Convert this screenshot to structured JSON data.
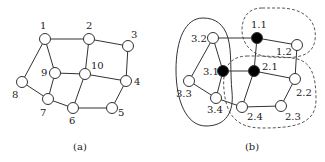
{
  "panel_a": {
    "caption": "(a)",
    "nodes": [
      {
        "id": "1",
        "x": 45,
        "y": 39,
        "lx": 40,
        "ly": 29
      },
      {
        "id": "2",
        "x": 89,
        "y": 39,
        "lx": 86,
        "ly": 29
      },
      {
        "id": "3",
        "x": 128,
        "y": 46,
        "lx": 131,
        "ly": 38
      },
      {
        "id": "4",
        "x": 126,
        "y": 81,
        "lx": 134,
        "ly": 85
      },
      {
        "id": "5",
        "x": 112,
        "y": 108,
        "lx": 118,
        "ly": 116
      },
      {
        "id": "6",
        "x": 73,
        "y": 108,
        "lx": 69,
        "ly": 124
      },
      {
        "id": "7",
        "x": 48,
        "y": 99,
        "lx": 40,
        "ly": 116
      },
      {
        "id": "8",
        "x": 22,
        "y": 82,
        "lx": 12,
        "ly": 98
      },
      {
        "id": "9",
        "x": 55,
        "y": 73,
        "lx": 41,
        "ly": 76
      },
      {
        "id": "10",
        "x": 85,
        "y": 74,
        "lx": 91,
        "ly": 69
      }
    ],
    "edges": [
      [
        "1",
        "2"
      ],
      [
        "2",
        "3"
      ],
      [
        "3",
        "4"
      ],
      [
        "4",
        "5"
      ],
      [
        "5",
        "6"
      ],
      [
        "6",
        "7"
      ],
      [
        "7",
        "8"
      ],
      [
        "8",
        "1"
      ],
      [
        "1",
        "9"
      ],
      [
        "9",
        "7"
      ],
      [
        "9",
        "10"
      ],
      [
        "10",
        "2"
      ],
      [
        "10",
        "4"
      ],
      [
        "10",
        "6"
      ]
    ]
  },
  "panel_b": {
    "caption": "(b)",
    "nodes": [
      {
        "id": "3.2",
        "x": 213,
        "y": 38,
        "lx": 191,
        "ly": 42,
        "filled": false
      },
      {
        "id": "1.1",
        "x": 257,
        "y": 38,
        "lx": 251,
        "ly": 28,
        "filled": true
      },
      {
        "id": "1.2",
        "x": 297,
        "y": 45,
        "lx": 276,
        "ly": 55,
        "filled": false
      },
      {
        "id": "3.1",
        "x": 223,
        "y": 71,
        "lx": 203,
        "ly": 75,
        "filled": true
      },
      {
        "id": "2.1",
        "x": 254,
        "y": 71,
        "lx": 262,
        "ly": 70,
        "filled": true
      },
      {
        "id": "2.2",
        "x": 295,
        "y": 79,
        "lx": 296,
        "ly": 96,
        "filled": false
      },
      {
        "id": "3.3",
        "x": 189,
        "y": 81,
        "lx": 176,
        "ly": 97,
        "filled": false
      },
      {
        "id": "3.4",
        "x": 216,
        "y": 98,
        "lx": 207,
        "ly": 113,
        "filled": false
      },
      {
        "id": "2.4",
        "x": 242,
        "y": 107,
        "lx": 247,
        "ly": 120,
        "filled": false
      },
      {
        "id": "2.3",
        "x": 281,
        "y": 106,
        "lx": 285,
        "ly": 120,
        "filled": false
      }
    ],
    "edges": [
      [
        "3.2",
        "1.1"
      ],
      [
        "1.1",
        "1.2"
      ],
      [
        "1.2",
        "2.2"
      ],
      [
        "2.2",
        "2.3"
      ],
      [
        "2.3",
        "2.4"
      ],
      [
        "2.4",
        "3.4"
      ],
      [
        "3.4",
        "3.3"
      ],
      [
        "3.3",
        "3.2"
      ],
      [
        "3.2",
        "3.1"
      ],
      [
        "3.1",
        "3.4"
      ],
      [
        "3.1",
        "2.1"
      ],
      [
        "2.1",
        "1.1"
      ],
      [
        "2.1",
        "2.2"
      ],
      [
        "2.1",
        "2.4"
      ]
    ],
    "regions": [
      {
        "name": "cluster-3",
        "style": "solid"
      },
      {
        "name": "cluster-1",
        "style": "dashed"
      },
      {
        "name": "cluster-2",
        "style": "dashed"
      }
    ]
  }
}
